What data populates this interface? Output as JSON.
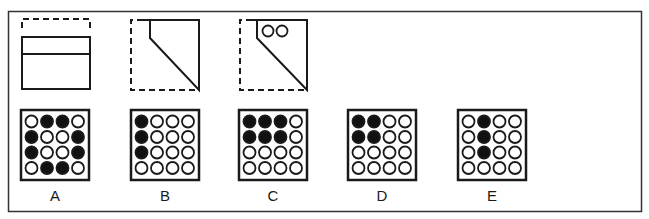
{
  "puzzle": {
    "instruction": "",
    "folding_steps": [
      {
        "id": "step-1",
        "description": "Square folded: top portion folded down along a horizontal line (dashed outline shows original top edge)"
      },
      {
        "id": "step-2",
        "description": "Folded along diagonal from top-left to bottom-right; dashed outline shows original square"
      },
      {
        "id": "step-3",
        "description": "Two holes punched near top of folded shape"
      }
    ],
    "options": [
      {
        "label": "A",
        "grid": [
          [
            0,
            1,
            1,
            0
          ],
          [
            1,
            0,
            0,
            1
          ],
          [
            1,
            0,
            0,
            1
          ],
          [
            0,
            1,
            1,
            0
          ]
        ]
      },
      {
        "label": "B",
        "grid": [
          [
            1,
            0,
            0,
            0
          ],
          [
            1,
            0,
            0,
            0
          ],
          [
            1,
            0,
            0,
            0
          ],
          [
            0,
            0,
            0,
            0
          ]
        ]
      },
      {
        "label": "C",
        "grid": [
          [
            1,
            1,
            1,
            0
          ],
          [
            1,
            1,
            1,
            0
          ],
          [
            0,
            0,
            0,
            0
          ],
          [
            0,
            0,
            0,
            0
          ]
        ]
      },
      {
        "label": "D",
        "grid": [
          [
            1,
            1,
            0,
            0
          ],
          [
            1,
            1,
            0,
            0
          ],
          [
            0,
            0,
            0,
            0
          ],
          [
            0,
            0,
            0,
            0
          ]
        ]
      },
      {
        "label": "E",
        "grid": [
          [
            0,
            1,
            0,
            0
          ],
          [
            0,
            1,
            0,
            0
          ],
          [
            0,
            1,
            0,
            0
          ],
          [
            0,
            0,
            0,
            0
          ]
        ]
      }
    ]
  },
  "colors": {
    "stroke": "#1a1a1a",
    "frame": "#333333",
    "fill_hole": "#111111",
    "background": "#ffffff"
  }
}
